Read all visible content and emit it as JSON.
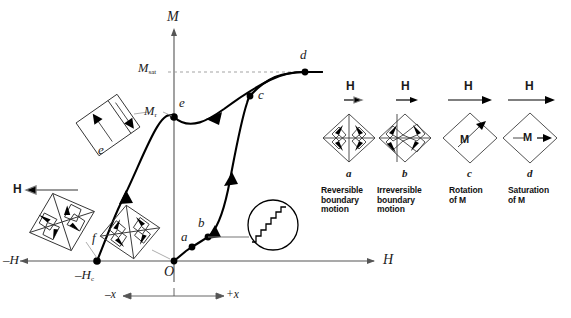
{
  "figure": {
    "kind": "magnetic-hysteresis-loop-with-domain-diagrams",
    "background_color": "#ffffff",
    "curve_color": "#000000",
    "axis_color": "#555555",
    "dashed_color": "#888888"
  },
  "axes": {
    "m_axis_label": "M",
    "h_axis_label_positive": "H",
    "h_axis_label_negative": "–H",
    "origin_label": "O",
    "m_sat_label": "M",
    "m_sat_sub": "sat",
    "m_r_label": "M",
    "m_r_sub": "r",
    "coercivity_label": "–H",
    "coercivity_sub": "c",
    "x_negative_label": "–x",
    "x_positive_label": "+x"
  },
  "curve_points": [
    {
      "id": "a",
      "label": "a",
      "x": 192,
      "y": 247,
      "label_x": 182,
      "label_y": 233
    },
    {
      "id": "b",
      "label": "b",
      "x": 208,
      "y": 237,
      "label_x": 199,
      "label_y": 220
    },
    {
      "id": "c",
      "label": "c",
      "x": 250,
      "y": 96,
      "label_x": 259,
      "label_y": 92
    },
    {
      "id": "d",
      "label": "d",
      "x": 305,
      "y": 72,
      "label_x": 301,
      "label_y": 54
    },
    {
      "id": "e",
      "label": "e",
      "x": 174,
      "y": 117,
      "label_x": 180,
      "label_y": 100
    },
    {
      "id": "f",
      "label": "f",
      "x": 97,
      "y": 261,
      "label_x": 96,
      "label_y": 236
    },
    {
      "id": "O",
      "label": "O",
      "x": 174,
      "y": 261,
      "label_x": 167,
      "label_y": 267
    }
  ],
  "left_domain_diagrams": [
    {
      "id": "e-domain",
      "label": "e",
      "type": "rotated-square-two-domains"
    },
    {
      "id": "f-domain",
      "label": "f",
      "type": "four-domain-closure",
      "field_label": "H"
    },
    {
      "id": "origin-domain",
      "label": "",
      "type": "four-domain-closure"
    }
  ],
  "barkhausen_inset": {
    "name": "barkhausen-jumps-inset",
    "description": "staircase magnification of curve segment"
  },
  "right_panel": {
    "items": [
      {
        "id": "a",
        "letter": "a",
        "field_label": "H",
        "caption": "Reversible\nboundary\nmotion",
        "diagram": "four-domain-closure-reversible"
      },
      {
        "id": "b",
        "letter": "b",
        "field_label": "H",
        "caption": "Irreversible\nboundary\nmotion",
        "diagram": "four-domain-closure-irreversible"
      },
      {
        "id": "c",
        "letter": "c",
        "field_label": "H",
        "caption": "Rotation\nof M",
        "diagram": "single-domain-rotating",
        "m_label": "M"
      },
      {
        "id": "d",
        "letter": "d",
        "field_label": "H",
        "caption": "Saturation\nof M",
        "diagram": "single-domain-saturated",
        "m_label": "M"
      }
    ]
  }
}
